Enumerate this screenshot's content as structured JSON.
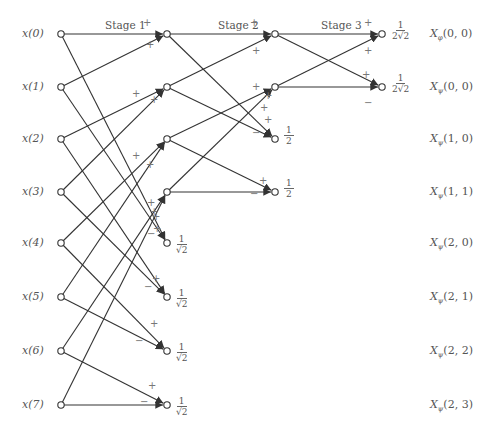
{
  "stages": [
    {
      "label": "Stage 1",
      "x": 105,
      "y": 26
    },
    {
      "label": "Stage 2",
      "x": 218,
      "y": 26
    },
    {
      "label": "Stage 3",
      "x": 321,
      "y": 26
    }
  ],
  "inputs": [
    {
      "label": "x(0)",
      "y": 34
    },
    {
      "label": "x(1)",
      "y": 87
    },
    {
      "label": "x(2)",
      "y": 139
    },
    {
      "label": "x(3)",
      "y": 192
    },
    {
      "label": "x(4)",
      "y": 243
    },
    {
      "label": "x(5)",
      "y": 297
    },
    {
      "label": "x(6)",
      "y": 351
    },
    {
      "label": "x(7)",
      "y": 405
    }
  ],
  "columns_x": {
    "input": 61,
    "stage1": 167,
    "stage2": 275,
    "stage3": 382
  },
  "scale_factors": {
    "stage1": {
      "num": "1",
      "den": "√2"
    },
    "stage2": {
      "num": "1",
      "den": "2"
    },
    "stage3": {
      "num": "1",
      "den": "2√2"
    }
  },
  "outputs": [
    {
      "label": "Xφ(0, 0)",
      "base": "X",
      "sub": "φ",
      "args": "(0, 0)",
      "y": 34
    },
    {
      "label": "Xψ(0, 0)",
      "base": "X",
      "sub": "ψ",
      "args": "(0, 0)",
      "y": 87
    },
    {
      "label": "Xψ(1, 0)",
      "base": "X",
      "sub": "ψ",
      "args": "(1, 0)",
      "y": 139
    },
    {
      "label": "Xψ(1, 1)",
      "base": "X",
      "sub": "ψ",
      "args": "(1, 1)",
      "y": 192
    },
    {
      "label": "Xψ(2, 0)",
      "base": "X",
      "sub": "ψ",
      "args": "(2, 0)",
      "y": 243
    },
    {
      "label": "Xψ(2, 1)",
      "base": "X",
      "sub": "ψ",
      "args": "(2, 1)",
      "y": 297
    },
    {
      "label": "Xψ(2, 2)",
      "base": "X",
      "sub": "ψ",
      "args": "(2, 2)",
      "y": 351
    },
    {
      "label": "Xψ(2, 3)",
      "base": "X",
      "sub": "ψ",
      "args": "(2, 3)",
      "y": 405
    }
  ],
  "signs": {
    "plus": "+",
    "minus": "−"
  },
  "colors": {
    "line": "#333333",
    "node_stroke": "#333333",
    "text": "#555555",
    "sign": "#777777"
  }
}
